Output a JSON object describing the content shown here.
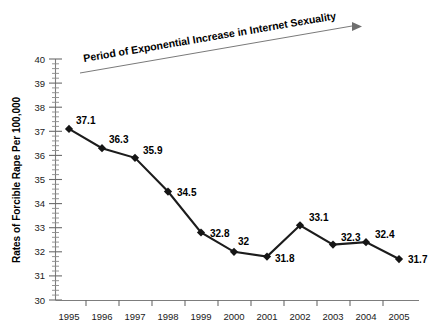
{
  "chart_data": {
    "type": "line",
    "title": "",
    "xlabel": "",
    "ylabel": "Rates of Forcible Rape Per 100,000",
    "categories": [
      "1995",
      "1996",
      "1997",
      "1998",
      "1999",
      "2000",
      "2001",
      "2002",
      "2003",
      "2004",
      "2005"
    ],
    "values": [
      37.1,
      36.3,
      35.9,
      34.5,
      32.8,
      32,
      31.8,
      33.1,
      32.3,
      32.4,
      31.7
    ],
    "data_labels": [
      "37.1",
      "36.3",
      "35.9",
      "34.5",
      "32.8",
      "32",
      "31.8",
      "33.1",
      "32.3",
      "32.4",
      "31.7"
    ],
    "ylim": [
      30,
      40
    ],
    "ytick_labels": [
      "40",
      "39",
      "38",
      "37",
      "36",
      "35",
      "34",
      "33",
      "32",
      "31",
      "30"
    ],
    "yticks": [
      40,
      39,
      38,
      37,
      36,
      35,
      34,
      33,
      32,
      31,
      30
    ],
    "minor_ticks_per_interval": 4,
    "grid": false,
    "legend": false,
    "marker": "diamond",
    "line_color": "#1c1c1c",
    "marker_color": "#151515",
    "background_color": "#ffffff",
    "annotations": [
      {
        "name": "period-annotation",
        "text": "Period of Exponential Increase in Internet Sexuality",
        "arrow": true,
        "rotation_deg": -9.5
      }
    ]
  },
  "axes": {
    "y_axis_title": "Rates of Forcible Rape Per 100,000",
    "y_tick_labels": [
      "40",
      "39",
      "38",
      "37",
      "36",
      "35",
      "34",
      "33",
      "32",
      "31",
      "30"
    ],
    "x_tick_labels": [
      "1995",
      "1996",
      "1997",
      "1998",
      "1999",
      "2000",
      "2001",
      "2002",
      "2003",
      "2004",
      "2005"
    ]
  },
  "annotation": {
    "label": "Period of Exponential Increase in Internet Sexuality"
  },
  "point_labels": {
    "p0": "37.1",
    "p1": "36.3",
    "p2": "35.9",
    "p3": "34.5",
    "p4": "32.8",
    "p5": "32",
    "p6": "31.8",
    "p7": "33.1",
    "p8": "32.3",
    "p9": "32.4",
    "p10": "31.7"
  }
}
